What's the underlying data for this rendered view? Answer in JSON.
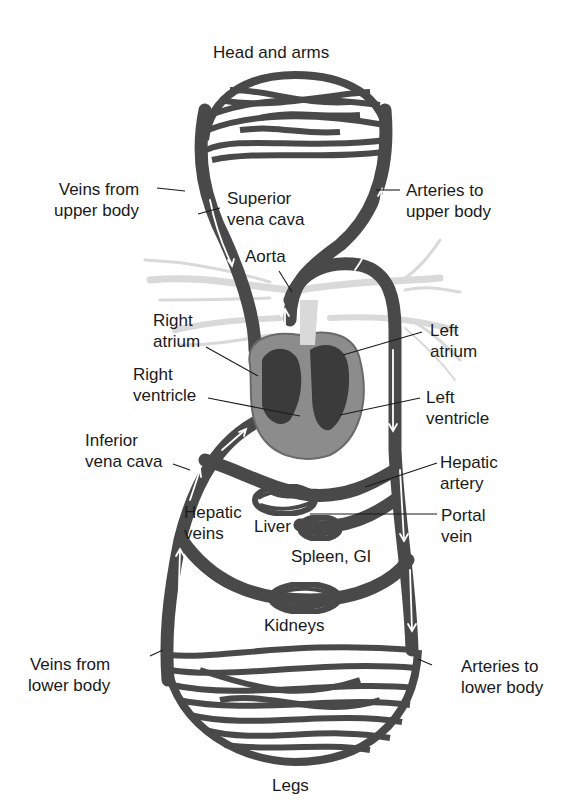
{
  "diagram": {
    "title": "",
    "colors": {
      "vessel": "#4a4a4a",
      "vessel_edge": "#2e2e2e",
      "flow_arrow": "#ffffff",
      "heart_outer": "#8c8c8c",
      "heart_chamber": "#3a3a3a",
      "pulmonary": "#d9d9d9",
      "leader_line": "#1a1a1a",
      "background": "#ffffff"
    },
    "nodes": [
      {
        "id": "head-arms",
        "label": "Head and arms",
        "type": "capillary-bed"
      },
      {
        "id": "heart",
        "label": "Heart",
        "type": "organ"
      },
      {
        "id": "liver",
        "label": "Liver",
        "type": "capillary-bed"
      },
      {
        "id": "spleen-gi",
        "label": "Spleen, GI",
        "type": "capillary-bed"
      },
      {
        "id": "kidneys",
        "label": "Kidneys",
        "type": "capillary-bed"
      },
      {
        "id": "legs",
        "label": "Legs",
        "type": "capillary-bed"
      }
    ],
    "edges": [
      {
        "from": "heart",
        "to": "head-arms",
        "label": "Arteries to upper body"
      },
      {
        "from": "head-arms",
        "to": "heart",
        "label": "Veins from upper body / Superior vena cava"
      },
      {
        "from": "heart",
        "to": "liver",
        "label": "Hepatic artery"
      },
      {
        "from": "spleen-gi",
        "to": "liver",
        "label": "Portal vein"
      },
      {
        "from": "liver",
        "to": "heart",
        "label": "Hepatic veins / Inferior vena cava"
      },
      {
        "from": "heart",
        "to": "kidneys",
        "label": ""
      },
      {
        "from": "heart",
        "to": "legs",
        "label": "Arteries to lower body"
      },
      {
        "from": "legs",
        "to": "heart",
        "label": "Veins from lower body"
      }
    ]
  },
  "labels": {
    "head_and_arms": "Head and arms",
    "veins_upper": "Veins from\nupper body",
    "superior_vena_cava": "Superior\nvena cava",
    "arteries_upper": "Arteries to\nupper body",
    "aorta": "Aorta",
    "right_atrium": "Right\natrium",
    "left_atrium": "Left\natrium",
    "right_ventricle": "Right\nventricle",
    "left_ventricle": "Left\nventricle",
    "inferior_vena_cava": "Inferior\nvena cava",
    "hepatic_artery": "Hepatic\nartery",
    "hepatic_veins": "Hepatic\nveins",
    "liver": "Liver",
    "portal_vein": "Portal\nvein",
    "spleen_gi": "Spleen, GI",
    "kidneys": "Kidneys",
    "veins_lower": "Veins from\nlower body",
    "arteries_lower": "Arteries to\nlower body",
    "legs": "Legs"
  }
}
